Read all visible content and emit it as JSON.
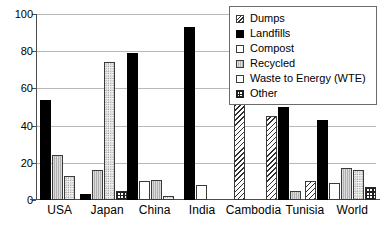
{
  "chart_data": {
    "type": "bar",
    "title": "",
    "subtitle": "",
    "xlabel": "",
    "ylabel": "",
    "ylim": [
      0,
      100
    ],
    "yticks": [
      0,
      20,
      40,
      60,
      80,
      100
    ],
    "grid": true,
    "legend_position": "top-right",
    "categories": [
      "USA",
      "Japan",
      "China",
      "India",
      "Cambodia",
      "Tunisia",
      "World"
    ],
    "series": [
      {
        "name": "Dumps",
        "pattern": "diagonal-hatch",
        "color": "#ffffff",
        "values": [
          0,
          0,
          0,
          0,
          100,
          45,
          10
        ]
      },
      {
        "name": "Landfills",
        "pattern": "solid-black",
        "color": "#000000",
        "values": [
          54,
          3,
          79,
          93,
          0,
          50,
          43
        ]
      },
      {
        "name": "Compost",
        "pattern": "white-outline",
        "color": "#ffffff",
        "values": [
          0,
          0,
          10,
          8,
          0,
          0,
          9
        ]
      },
      {
        "name": "Recycled",
        "pattern": "gray-vertical",
        "color": "#b0b0b0",
        "values": [
          24,
          16,
          11,
          0,
          0,
          5,
          17
        ]
      },
      {
        "name": "Waste to Energy (WTE)",
        "pattern": "light-dotted",
        "color": "#f2f2f2",
        "values": [
          13,
          74,
          2,
          0,
          0,
          0,
          16
        ]
      },
      {
        "name": "Other",
        "pattern": "checkerboard",
        "color": "#ffffff",
        "values": [
          0,
          5,
          0,
          0,
          0,
          0,
          7
        ]
      }
    ]
  },
  "legend": {
    "items": [
      {
        "label": "Dumps"
      },
      {
        "label": "Landfills"
      },
      {
        "label": "Compost"
      },
      {
        "label": "Recycled"
      },
      {
        "label": "Waste to Energy (WTE)"
      },
      {
        "label": "Other"
      }
    ]
  },
  "axis": {
    "y_tick_labels": [
      "100",
      "80",
      "60",
      "40",
      "20",
      "0"
    ]
  }
}
